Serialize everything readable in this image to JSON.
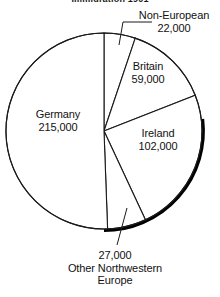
{
  "chart_data": {
    "type": "pie",
    "title": "Immigration 1901",
    "title_truncated": true,
    "categories": [
      "Non-European",
      "Britain",
      "Ireland",
      "Other Northwestern Europe",
      "Germany"
    ],
    "values": [
      22000,
      59000,
      102000,
      27000,
      215000
    ],
    "value_labels": [
      "22,000",
      "59,000",
      "102,000",
      "27,000",
      "215,000"
    ],
    "total": 425000,
    "start_angle_deg": 0,
    "direction": "clockwise",
    "slices": [
      {
        "label": "Non-European",
        "value": 22000,
        "value_label": "22,000",
        "start_deg": 0.0,
        "end_deg": 18.6,
        "percent": 5.2,
        "fill": "#ffffff",
        "stroke": "#1a1a1a"
      },
      {
        "label": "Britain",
        "value": 59000,
        "value_label": "59,000",
        "start_deg": 18.6,
        "end_deg": 68.6,
        "percent": 13.9,
        "fill": "#ffffff",
        "stroke": "#1a1a1a"
      },
      {
        "label": "Ireland",
        "value": 102000,
        "value_label": "102,000",
        "start_deg": 68.6,
        "end_deg": 155.0,
        "percent": 24.0,
        "fill": "#ffffff",
        "stroke": "#1a1a1a"
      },
      {
        "label": "Other Northwestern Europe",
        "value": 27000,
        "value_label": "27,000",
        "start_deg": 155.0,
        "end_deg": 177.9,
        "percent": 6.4,
        "fill": "#ffffff",
        "stroke": "#1a1a1a"
      },
      {
        "label": "Germany",
        "value": 215000,
        "value_label": "215,000",
        "start_deg": 177.9,
        "end_deg": 360.0,
        "percent": 50.6,
        "fill": "#ffffff",
        "stroke": "#1a1a1a"
      }
    ],
    "legend": "none",
    "grid": false,
    "xlabel": "",
    "ylabel": ""
  },
  "labels": {
    "germany": {
      "name": "Germany",
      "value": "215,000"
    },
    "britain": {
      "name": "Britain",
      "value": "59,000"
    },
    "ireland": {
      "name": "Ireland",
      "value": "102,000"
    },
    "non_european": {
      "name": "Non-European",
      "value": "22,000"
    },
    "other": {
      "value": "27,000",
      "line1": "Other Northwestern",
      "line2": "Europe"
    }
  },
  "style": {
    "outline_color": "#1a1a1a",
    "shadow_color": "#000000",
    "slice_fill": "#ffffff",
    "background": "#ffffff",
    "text_color": "#111111"
  }
}
